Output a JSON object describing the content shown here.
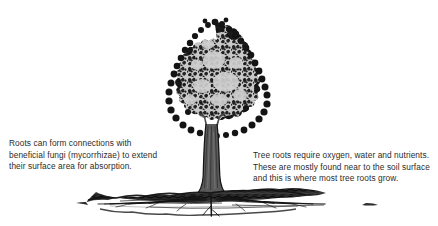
{
  "figure": {
    "kind": "tree-root-diagram",
    "background_color": "#ffffff",
    "text_color": "#2b2b2b"
  },
  "illustration": {
    "tree": {
      "name": "deciduous-tree",
      "canopy_fill_color": "#c9c9c9",
      "canopy_stroke_color": "#1a1a1a",
      "trunk_color": "#555555",
      "trunk_stroke_color": "#1a1a1a",
      "canopy_bounds": {
        "x": 168,
        "y": 22,
        "width": 104,
        "height": 116
      },
      "trunk_bounds": {
        "x": 203,
        "y": 115,
        "width": 16,
        "height": 85
      }
    },
    "soil": {
      "name": "soil-layer",
      "fill_color": "#2e2e2e",
      "bounds": {
        "x": 85,
        "y": 193,
        "width": 285,
        "height": 22
      }
    },
    "roots": {
      "name": "root-system",
      "color": "#1f1f1f"
    }
  },
  "callouts": {
    "left": {
      "name": "mycorrhizae-note",
      "lines": [
        "Roots can form connections with",
        "beneficial fungi (mycorrhizae) to extend",
        "their surface area for absorption."
      ]
    },
    "right": {
      "name": "root-requirements-note",
      "lines": [
        "Tree roots require oxygen, water and nutrients.",
        "These are mostly found near to the soil surface",
        "and this is where most tree roots grow."
      ]
    }
  }
}
